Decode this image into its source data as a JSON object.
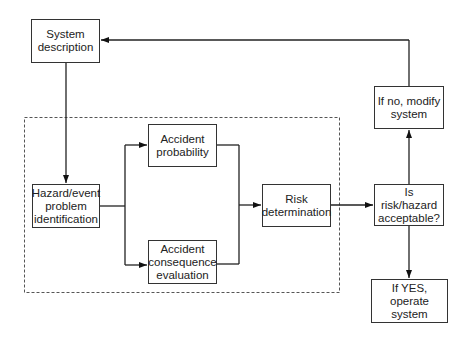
{
  "diagram": {
    "nodes": [
      {
        "id": "system-description",
        "label": "System\ndescription"
      },
      {
        "id": "hazard-identification",
        "label": "Hazard/event\nproblem\nidentification"
      },
      {
        "id": "accident-probability",
        "label": "Accident\nprobability"
      },
      {
        "id": "accident-consequence",
        "label": "Accident\nconsequence\nevaluation"
      },
      {
        "id": "risk-determination",
        "label": "Risk\ndetermination"
      },
      {
        "id": "risk-acceptable",
        "label": "Is risk/hazard\nacceptable?"
      },
      {
        "id": "modify-system",
        "label": "If no, modify\nsystem"
      },
      {
        "id": "operate-system",
        "label": "If YES, operate\nsystem"
      }
    ],
    "edges": [
      {
        "from": "system-description",
        "to": "hazard-identification"
      },
      {
        "from": "hazard-identification",
        "to": "accident-probability"
      },
      {
        "from": "hazard-identification",
        "to": "accident-consequence"
      },
      {
        "from": "accident-probability",
        "to": "risk-determination"
      },
      {
        "from": "accident-consequence",
        "to": "risk-determination"
      },
      {
        "from": "risk-determination",
        "to": "risk-acceptable"
      },
      {
        "from": "risk-acceptable",
        "to": "modify-system"
      },
      {
        "from": "risk-acceptable",
        "to": "operate-system"
      },
      {
        "from": "modify-system",
        "to": "system-description"
      }
    ],
    "colors": {
      "line": "#222222",
      "box_border": "#333333",
      "dashed": "#555555"
    }
  }
}
